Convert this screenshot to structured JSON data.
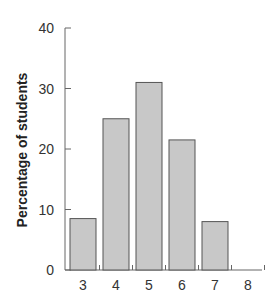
{
  "chart_data": {
    "type": "bar",
    "title": "",
    "xlabel": "",
    "ylabel": "Percentage of students",
    "categories": [
      "3",
      "4",
      "5",
      "6",
      "7",
      "8"
    ],
    "values": [
      8.5,
      25,
      31,
      21.5,
      8,
      0
    ],
    "ylim": [
      0,
      40
    ],
    "yticks": [
      0,
      10,
      20,
      30,
      40
    ],
    "grid": false,
    "legend": null,
    "colors": {
      "bar_fill": "#c8c8c8",
      "bar_edge": "#555555",
      "axis": "#666666",
      "text": "#333333"
    }
  }
}
